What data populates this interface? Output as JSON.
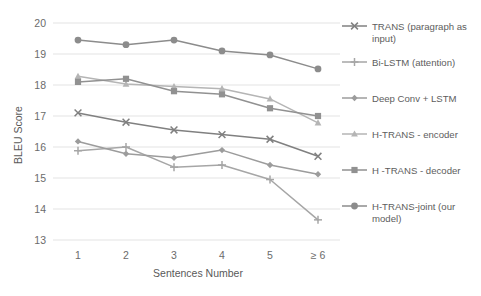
{
  "chart_data": {
    "type": "line",
    "title": "",
    "xlabel": "Sentences Number",
    "ylabel": "BLEU Score",
    "categories": [
      "1",
      "2",
      "3",
      "4",
      "5",
      "≥ 6"
    ],
    "ylim": [
      13,
      20
    ],
    "yticks": [
      "13",
      "14",
      "15",
      "16",
      "17",
      "18",
      "19",
      "20"
    ],
    "grid": "horizontal",
    "legend_position": "right",
    "series": [
      {
        "name": "TRANS (paragraph as input)",
        "marker": "x-cross",
        "color": "#808080",
        "values": [
          17.1,
          16.8,
          16.55,
          16.4,
          16.25,
          15.7
        ]
      },
      {
        "name": "Bi-LSTM (attention)",
        "marker": "plus",
        "color": "#a6a6a6",
        "values": [
          15.88,
          16.0,
          15.35,
          15.42,
          14.95,
          13.65
        ]
      },
      {
        "name": "Deep Conv + LSTM",
        "marker": "diamond",
        "color": "#9c9c9c",
        "values": [
          16.18,
          15.78,
          15.65,
          15.9,
          15.42,
          15.12
        ]
      },
      {
        "name": "H-TRANS - encoder",
        "marker": "triangle",
        "color": "#b5b5b5",
        "values": [
          18.28,
          18.03,
          17.95,
          17.88,
          17.55,
          16.78
        ]
      },
      {
        "name": "H -TRANS - decoder",
        "marker": "square",
        "color": "#919191",
        "values": [
          18.1,
          18.2,
          17.8,
          17.7,
          17.25,
          17.0
        ]
      },
      {
        "name": "H-TRANS-joint (our model)",
        "marker": "circle",
        "color": "#8c8c8c",
        "values": [
          19.45,
          19.3,
          19.45,
          19.1,
          18.97,
          18.52
        ]
      }
    ]
  },
  "legend": {
    "items": [
      {
        "label": "TRANS (paragraph as",
        "label2": "input)"
      },
      {
        "label": "Bi-LSTM (attention)",
        "label2": ""
      },
      {
        "label": "Deep Conv + LSTM",
        "label2": ""
      },
      {
        "label": "H-TRANS - encoder",
        "label2": ""
      },
      {
        "label": "H -TRANS - decoder",
        "label2": ""
      },
      {
        "label": "H-TRANS-joint (our",
        "label2": "model)"
      }
    ]
  }
}
